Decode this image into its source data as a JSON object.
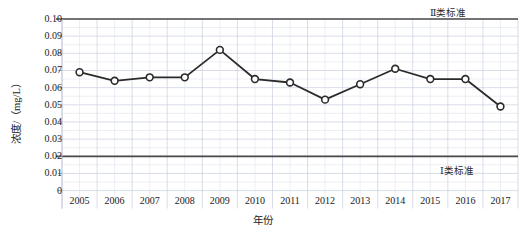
{
  "chart_data": {
    "type": "line",
    "title": "",
    "xlabel": "年份",
    "ylabel": "浓度/（mg/L）",
    "categories": [
      "2005",
      "2006",
      "2007",
      "2008",
      "2009",
      "2010",
      "2011",
      "2012",
      "2013",
      "2014",
      "2015",
      "2016",
      "2017"
    ],
    "values": [
      0.069,
      0.064,
      0.066,
      0.066,
      0.082,
      0.065,
      0.063,
      0.053,
      0.062,
      0.071,
      0.065,
      0.065,
      0.049
    ],
    "series": [
      {
        "name": "浓度",
        "values": [
          0.069,
          0.064,
          0.066,
          0.066,
          0.082,
          0.065,
          0.063,
          0.053,
          0.062,
          0.071,
          0.065,
          0.065,
          0.049
        ]
      }
    ],
    "ylim": [
      0,
      0.1
    ],
    "ytick_labels": [
      "0.10",
      "0.09",
      "0.08",
      "0.07",
      "0.06",
      "0.05",
      "0.04",
      "0.03",
      "0.02",
      "0.01",
      "0"
    ],
    "ytick_values": [
      0.1,
      0.09,
      0.08,
      0.07,
      0.06,
      0.05,
      0.04,
      0.03,
      0.02,
      0.01,
      0
    ],
    "grid": true,
    "legend_position": "none",
    "marker": "open-circle",
    "line_color": "#2b2b2b",
    "marker_fill": "#ffffff",
    "grid_color": "#c8cfe0",
    "reference_lines": [
      {
        "label": "Ⅱ类标准",
        "value": 0.1,
        "color": "#4a4a4a"
      },
      {
        "label": "Ⅰ类标准",
        "value": 0.02,
        "color": "#4a4a4a"
      }
    ],
    "annotations": [
      "Ⅱ类标准",
      "Ⅰ类标准"
    ]
  },
  "axis": {
    "y_title": "浓度/（mg/L）",
    "x_title": "年份"
  },
  "standards": {
    "class2": "Ⅱ类标准",
    "class1": "Ⅰ类标准"
  }
}
